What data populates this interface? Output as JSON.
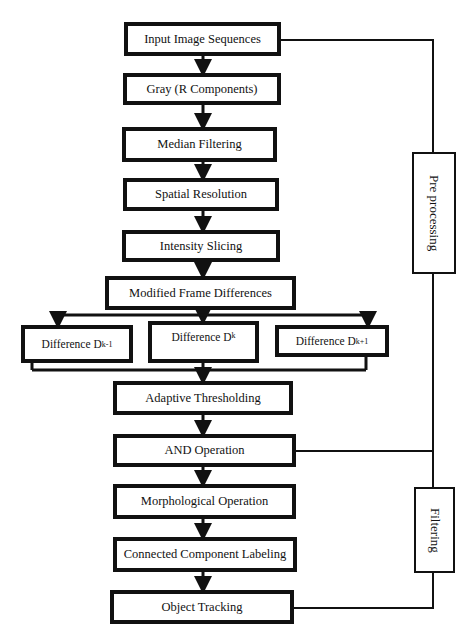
{
  "diagram": {
    "type": "flowchart",
    "steps": [
      {
        "id": "input",
        "label": "Input Image Sequences"
      },
      {
        "id": "gray",
        "label": "Gray (R Components)"
      },
      {
        "id": "median",
        "label": "Median Filtering"
      },
      {
        "id": "spatial",
        "label": "Spatial Resolution"
      },
      {
        "id": "intensity",
        "label": "Intensity Slicing"
      },
      {
        "id": "modified",
        "label": "Modified Frame Differences"
      },
      {
        "id": "adaptive",
        "label": "Adaptive Thresholding"
      },
      {
        "id": "and",
        "label": "AND Operation"
      },
      {
        "id": "morph",
        "label": "Morphological Operation"
      },
      {
        "id": "connected",
        "label": "Connected Component Labeling"
      },
      {
        "id": "tracking",
        "label": "Object Tracking"
      }
    ],
    "differences": [
      {
        "label": "Difference D",
        "sub": "k-1"
      },
      {
        "label": "Difference D",
        "sub": "k"
      },
      {
        "label": "Difference D",
        "sub": "k+1"
      }
    ],
    "groups": {
      "preprocessing": "Pre processing",
      "filtering": "Filtering"
    }
  }
}
